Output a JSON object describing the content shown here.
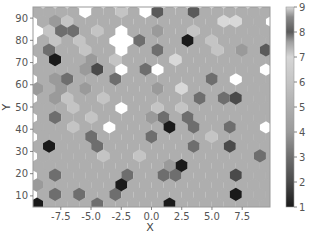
{
  "chart_data": {
    "type": "heatmap",
    "subtype": "hexbin",
    "title": "",
    "xlabel": "X",
    "ylabel": "Y",
    "xlim": [
      -9.8,
      9.8
    ],
    "ylim": [
      5,
      95
    ],
    "xticks": [
      -7.5,
      -5.0,
      -2.5,
      0.0,
      2.5,
      5.0,
      7.5
    ],
    "xtick_labels": [
      "-7.5",
      "-5.0",
      "-2.5",
      "0.0",
      "2.5",
      "5.0",
      "7.5"
    ],
    "yticks": [
      10,
      20,
      30,
      40,
      50,
      60,
      70,
      80,
      90
    ],
    "ytick_labels": [
      "10",
      "20",
      "30",
      "40",
      "50",
      "60",
      "70",
      "80",
      "90"
    ],
    "grid": false,
    "colorbar": {
      "min": 1,
      "max": 9,
      "ticks": [
        1,
        2,
        3,
        4,
        5,
        6,
        7,
        8,
        9
      ],
      "tick_labels": [
        "1",
        "2",
        "3",
        "4",
        "5",
        "6",
        "7",
        "8",
        "9"
      ],
      "colormap_stops": [
        {
          "v": 1.0,
          "color": "#1a1a1a"
        },
        {
          "v": 2.0,
          "color": "#4a4a4a"
        },
        {
          "v": 3.0,
          "color": "#6e6e6e"
        },
        {
          "v": 4.0,
          "color": "#9a9a9a"
        },
        {
          "v": 5.0,
          "color": "#aeaeae"
        },
        {
          "v": 6.0,
          "color": "#c4c4c4"
        },
        {
          "v": 7.0,
          "color": "#d6d6d6"
        },
        {
          "v": 7.6,
          "color": "#a0a0a0"
        },
        {
          "v": 8.0,
          "color": "#5a5a5a"
        },
        {
          "v": 8.6,
          "color": "#8a8a8a"
        },
        {
          "v": 9.0,
          "color": "#d8d8d8"
        }
      ]
    },
    "grid_shape": {
      "rows": 21,
      "cols": 20
    },
    "note": "counts per hexagon (0 = empty), rows listed top (y≈92) to bottom (y≈8), approximated from image",
    "counts": [
      [
        5,
        5,
        5,
        5,
        0,
        5,
        5,
        6,
        5,
        0,
        8,
        5,
        5,
        8,
        5,
        5,
        5,
        5,
        5,
        5
      ],
      [
        5,
        4,
        6,
        5,
        5,
        5,
        5,
        5,
        5,
        5,
        5,
        5,
        5,
        5,
        5,
        9,
        9,
        5,
        5,
        0
      ],
      [
        0,
        6,
        3,
        3,
        5,
        6,
        5,
        0,
        5,
        5,
        4,
        5,
        5,
        6,
        5,
        5,
        5,
        5,
        5,
        5
      ],
      [
        5,
        6,
        5,
        6,
        5,
        5,
        0,
        0,
        3,
        5,
        5,
        5,
        1,
        5,
        6,
        5,
        5,
        5,
        5,
        5
      ],
      [
        5,
        3,
        5,
        5,
        6,
        5,
        5,
        0,
        5,
        5,
        3,
        5,
        5,
        5,
        5,
        6,
        5,
        4,
        5,
        8
      ],
      [
        5,
        1,
        5,
        5,
        4,
        5,
        6,
        5,
        5,
        5,
        5,
        9,
        5,
        5,
        5,
        5,
        5,
        5,
        5,
        5
      ],
      [
        5,
        5,
        5,
        5,
        4,
        2,
        5,
        0,
        5,
        3,
        0,
        5,
        5,
        5,
        5,
        5,
        5,
        5,
        5,
        0
      ],
      [
        5,
        4,
        3,
        5,
        5,
        5,
        3,
        5,
        5,
        5,
        5,
        5,
        5,
        5,
        3,
        5,
        0,
        5,
        5,
        5
      ],
      [
        4,
        5,
        4,
        5,
        4,
        5,
        5,
        5,
        5,
        5,
        4,
        5,
        9,
        5,
        5,
        5,
        5,
        5,
        5,
        5
      ],
      [
        5,
        4,
        6,
        5,
        5,
        6,
        5,
        5,
        5,
        5,
        5,
        5,
        5,
        3,
        5,
        3,
        2,
        5,
        5,
        5
      ],
      [
        5,
        5,
        5,
        6,
        5,
        5,
        5,
        0,
        5,
        5,
        6,
        5,
        6,
        5,
        5,
        5,
        5,
        5,
        5,
        5
      ],
      [
        5,
        3,
        5,
        5,
        6,
        5,
        5,
        5,
        5,
        4,
        3,
        5,
        3,
        5,
        5,
        5,
        5,
        5,
        5,
        5
      ],
      [
        5,
        5,
        5,
        6,
        5,
        5,
        0,
        5,
        5,
        5,
        5,
        1,
        5,
        3,
        5,
        5,
        3,
        5,
        5,
        0
      ],
      [
        5,
        5,
        5,
        5,
        3,
        5,
        5,
        5,
        5,
        3,
        5,
        5,
        5,
        5,
        6,
        5,
        5,
        5,
        5,
        5
      ],
      [
        5,
        1,
        5,
        5,
        5,
        3,
        5,
        5,
        5,
        5,
        5,
        5,
        5,
        3,
        5,
        5,
        2,
        5,
        5,
        5
      ],
      [
        5,
        5,
        5,
        5,
        5,
        6,
        5,
        5,
        6,
        5,
        5,
        5,
        5,
        5,
        5,
        5,
        5,
        5,
        3,
        5
      ],
      [
        5,
        5,
        5,
        5,
        5,
        5,
        5,
        5,
        5,
        5,
        5,
        4,
        1,
        5,
        5,
        5,
        5,
        5,
        5,
        5
      ],
      [
        5,
        3,
        5,
        5,
        5,
        5,
        5,
        3,
        5,
        5,
        3,
        3,
        5,
        5,
        5,
        5,
        2,
        5,
        5,
        5
      ],
      [
        4,
        5,
        5,
        5,
        5,
        5,
        5,
        1,
        5,
        5,
        5,
        5,
        5,
        5,
        5,
        5,
        5,
        5,
        5,
        5
      ],
      [
        5,
        3,
        5,
        3,
        5,
        5,
        3,
        5,
        5,
        5,
        5,
        5,
        5,
        5,
        5,
        5,
        1,
        5,
        5,
        5
      ],
      [
        1,
        5,
        5,
        5,
        5,
        3,
        5,
        5,
        5,
        5,
        5,
        1,
        5,
        5,
        5,
        5,
        5,
        5,
        5,
        5
      ]
    ]
  }
}
